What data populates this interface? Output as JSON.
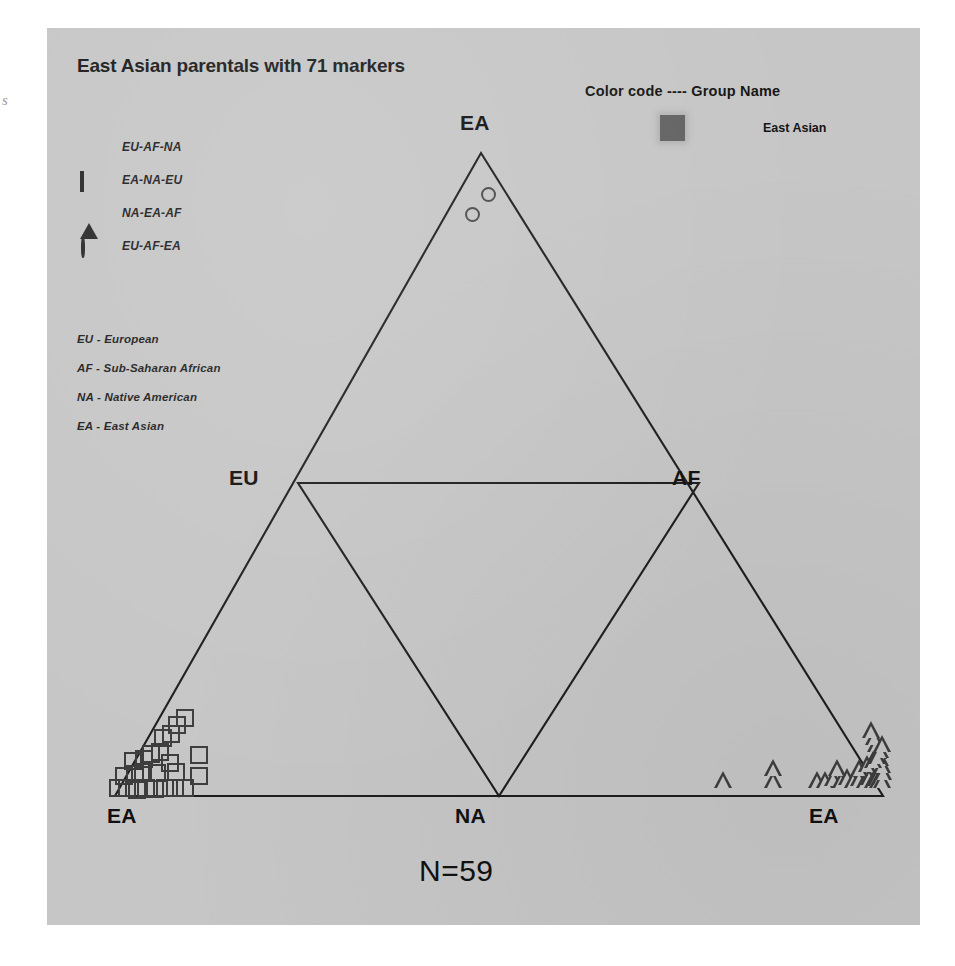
{
  "margin_note": "s",
  "chart": {
    "title": "East Asian parentals with 71 markers",
    "caption": "N=59",
    "background_color": "#c6c6c6",
    "line_color": "#1e1e1e"
  },
  "shape_legend": {
    "items": [
      {
        "glyph": "filled-circle-icon",
        "label": "EU-AF-NA"
      },
      {
        "glyph": "open-square-icon",
        "label": "EA-NA-EU"
      },
      {
        "glyph": "open-triangle-icon",
        "label": "NA-EA-AF"
      },
      {
        "glyph": "open-circle-icon",
        "label": "EU-AF-EA"
      }
    ]
  },
  "abbrev_key": {
    "rows": [
      "EU - European",
      "AF - Sub-Saharan African",
      "NA - Native American",
      "EA - East Asian"
    ]
  },
  "color_legend": {
    "title": "Color code ---- Group Name",
    "swatch_color": "#636363",
    "group_name": "East Asian"
  },
  "vertex_labels": {
    "top": "EA",
    "mid_left": "EU",
    "mid_right": "AF",
    "bottom_left": "EA",
    "bottom_center": "NA",
    "bottom_right": "EA"
  },
  "chart_data": {
    "type": "scatter",
    "title": "East Asian parentals with 71 markers",
    "subtitle": "N=59",
    "plot_style": "tetrahedral-projection triangle (unfolded 3-simplex)",
    "xlabel": "",
    "ylabel": "",
    "xlim": [
      0,
      873
    ],
    "ylim": [
      0,
      897
    ],
    "grid": false,
    "legend_position": "upper-left (shapes), upper-right (color code)",
    "annotations": [
      "EU - European",
      "AF - Sub-Saharan African",
      "NA - Native American",
      "EA - East Asian",
      "Color code ---- Group Name",
      "East Asian",
      "N=59"
    ],
    "axis_vertices": [
      {
        "label": "EA",
        "position": "top-apex",
        "x": 434,
        "y": 125
      },
      {
        "label": "EU",
        "position": "mid-left",
        "x": 251,
        "y": 455
      },
      {
        "label": "AF",
        "position": "mid-right",
        "x": 652,
        "y": 455
      },
      {
        "label": "EA",
        "position": "bottom-left",
        "x": 68,
        "y": 768
      },
      {
        "label": "NA",
        "position": "bottom-center",
        "x": 452,
        "y": 768
      },
      {
        "label": "EA",
        "position": "bottom-right",
        "x": 836,
        "y": 768
      }
    ],
    "series": [
      {
        "name": "EU-AF-NA",
        "marker": "filled-circle",
        "count": 0,
        "points": []
      },
      {
        "name": "EA-NA-EU",
        "marker": "open-square",
        "count": 24,
        "comment": "dense cluster hugging the bottom-left EA vertex along the EU-EA edge",
        "points": [
          [
            71,
            760
          ],
          [
            80,
            760
          ],
          [
            90,
            762
          ],
          [
            99,
            760
          ],
          [
            108,
            761
          ],
          [
            118,
            760
          ],
          [
            128,
            760
          ],
          [
            138,
            760
          ],
          [
            77,
            748
          ],
          [
            88,
            746
          ],
          [
            96,
            744
          ],
          [
            110,
            745
          ],
          [
            129,
            744
          ],
          [
            152,
            748
          ],
          [
            86,
            733
          ],
          [
            97,
            731
          ],
          [
            104,
            726
          ],
          [
            113,
            724
          ],
          [
            116,
            710
          ],
          [
            124,
            706
          ],
          [
            130,
            697
          ],
          [
            138,
            690
          ],
          [
            123,
            735
          ],
          [
            152,
            727
          ]
        ]
      },
      {
        "name": "NA-EA-AF",
        "marker": "open-triangle",
        "count": 31,
        "comment": "cluster hugging the bottom-right EA vertex along the NA-EA edge and AF-EA edge",
        "points": [
          [
            676,
            760
          ],
          [
            726,
            760
          ],
          [
            726,
            748
          ],
          [
            770,
            760
          ],
          [
            778,
            760
          ],
          [
            786,
            758
          ],
          [
            794,
            760
          ],
          [
            800,
            757
          ],
          [
            806,
            760
          ],
          [
            812,
            758
          ],
          [
            818,
            760
          ],
          [
            822,
            757
          ],
          [
            826,
            760
          ],
          [
            829,
            758
          ],
          [
            831,
            760
          ],
          [
            833,
            757
          ],
          [
            835,
            760
          ],
          [
            836,
            752
          ],
          [
            835,
            745
          ],
          [
            833,
            738
          ],
          [
            831,
            731
          ],
          [
            829,
            724
          ],
          [
            827,
            717
          ],
          [
            824,
            710
          ],
          [
            790,
            748
          ],
          [
            812,
            748
          ],
          [
            820,
            744
          ],
          [
            826,
            740
          ],
          [
            830,
            736
          ],
          [
            833,
            730
          ],
          [
            835,
            724
          ]
        ]
      },
      {
        "name": "EU-AF-EA",
        "marker": "open-circle",
        "count": 2,
        "comment": "two points just below the top EA apex on the EU-EA edge",
        "points": [
          [
            441,
            166
          ],
          [
            425,
            186
          ]
        ]
      }
    ]
  }
}
